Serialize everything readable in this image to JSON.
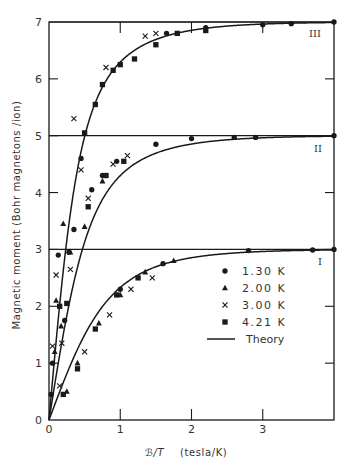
{
  "chart_data": {
    "type": "scatter",
    "title": "",
    "xlabel": "B/T (tesla/K)",
    "xlabel_symbol": "ℬ/T",
    "xlabel_units": "(tesla/K)",
    "ylabel": "Magnetic moment (Bohr magnetons /ion)",
    "xlim": [
      0,
      4.0
    ],
    "ylim": [
      0,
      7
    ],
    "x_ticks": [
      0,
      1,
      2,
      3
    ],
    "y_ticks": [
      0,
      1,
      2,
      3,
      4,
      5,
      6,
      7
    ],
    "x_tick_labels": [
      "0",
      "1",
      "2",
      "3"
    ],
    "y_tick_labels": [
      "0",
      "1",
      "2",
      "3",
      "4",
      "5",
      "6",
      "7"
    ],
    "grid": false,
    "horizontal_reference_lines": [
      3,
      5,
      7
    ],
    "legend_position": "lower right (inside, near y=1.3-2.9)",
    "legend": [
      {
        "marker": "circle",
        "label": "1.30 K"
      },
      {
        "marker": "triangle",
        "label": "2.00 K"
      },
      {
        "marker": "cross",
        "label": "3.00 K"
      },
      {
        "marker": "square",
        "label": "4.21 K"
      },
      {
        "marker": "line",
        "label": "Theory"
      }
    ],
    "curve_labels": [
      {
        "label": "I",
        "saturation": 3,
        "J": 1.5
      },
      {
        "label": "II",
        "saturation": 5,
        "J": 2.5
      },
      {
        "label": "III",
        "saturation": 7,
        "J": 3.5
      }
    ],
    "theory_curves": [
      {
        "name": "I (Theory)",
        "x": [
          0,
          0.25,
          0.5,
          0.75,
          1.0,
          1.25,
          1.5,
          2.0,
          2.5,
          3.0,
          3.5,
          4.0
        ],
        "y": [
          0,
          0.88,
          1.62,
          2.11,
          2.45,
          2.65,
          2.78,
          2.91,
          2.96,
          2.98,
          2.99,
          3.0
        ]
      },
      {
        "name": "II (Theory)",
        "x": [
          0,
          0.1,
          0.2,
          0.3,
          0.4,
          0.5,
          0.75,
          1.0,
          1.25,
          1.5,
          2.0,
          2.5,
          3.0,
          4.0
        ],
        "y": [
          0,
          1.2,
          2.25,
          3.0,
          3.55,
          3.95,
          4.45,
          4.72,
          4.84,
          4.91,
          4.96,
          4.98,
          4.99,
          5.0
        ]
      },
      {
        "name": "III (Theory)",
        "x": [
          0,
          0.05,
          0.1,
          0.2,
          0.3,
          0.4,
          0.5,
          0.75,
          1.0,
          1.5,
          2.0,
          2.5,
          3.0,
          4.0
        ],
        "y": [
          0,
          0.9,
          1.75,
          3.3,
          4.5,
          5.25,
          5.75,
          6.35,
          6.6,
          6.82,
          6.9,
          6.95,
          6.97,
          7.0
        ]
      }
    ],
    "series": [
      {
        "name": "1.30 K",
        "marker": "circle",
        "points": [
          [
            0.05,
            1.0
          ],
          [
            0.13,
            2.9
          ],
          [
            0.45,
            4.6
          ],
          [
            0.03,
            0.45
          ],
          [
            0.22,
            1.75
          ],
          [
            0.28,
            2.95
          ],
          [
            0.35,
            3.35
          ],
          [
            0.6,
            4.05
          ],
          [
            0.75,
            4.3
          ],
          [
            0.95,
            4.55
          ],
          [
            1.5,
            4.85
          ],
          [
            2.0,
            4.95
          ],
          [
            2.6,
            4.97
          ],
          [
            2.9,
            4.97
          ],
          [
            4.0,
            5.0
          ],
          [
            1.0,
            2.3
          ],
          [
            1.6,
            2.75
          ],
          [
            2.8,
            2.98
          ],
          [
            3.7,
            2.99
          ],
          [
            4.0,
            3.0
          ],
          [
            1.65,
            6.8
          ],
          [
            2.2,
            6.9
          ],
          [
            3.0,
            6.95
          ],
          [
            3.4,
            6.97
          ],
          [
            4.0,
            7.0
          ]
        ]
      },
      {
        "name": "2.00 K",
        "marker": "triangle",
        "points": [
          [
            0.08,
            1.2
          ],
          [
            0.1,
            2.1
          ],
          [
            0.2,
            3.45
          ],
          [
            0.17,
            1.65
          ],
          [
            0.3,
            2.95
          ],
          [
            0.5,
            3.4
          ],
          [
            0.75,
            4.2
          ],
          [
            0.25,
            0.5
          ],
          [
            0.4,
            1.0
          ],
          [
            0.7,
            1.7
          ],
          [
            1.0,
            2.2
          ],
          [
            1.35,
            2.6
          ],
          [
            1.75,
            2.8
          ]
        ]
      },
      {
        "name": "3.00 K",
        "marker": "cross",
        "points": [
          [
            0.05,
            1.3
          ],
          [
            0.1,
            2.55
          ],
          [
            0.45,
            4.4
          ],
          [
            0.18,
            1.35
          ],
          [
            0.3,
            2.65
          ],
          [
            0.55,
            3.9
          ],
          [
            0.9,
            4.5
          ],
          [
            1.1,
            4.65
          ],
          [
            0.15,
            0.6
          ],
          [
            0.5,
            1.2
          ],
          [
            0.85,
            1.85
          ],
          [
            1.15,
            2.3
          ],
          [
            1.45,
            2.5
          ],
          [
            0.35,
            5.3
          ],
          [
            0.8,
            6.2
          ],
          [
            1.35,
            6.75
          ],
          [
            1.5,
            6.8
          ]
        ]
      },
      {
        "name": "4.21 K",
        "marker": "square",
        "points": [
          [
            0.15,
            2.0
          ],
          [
            0.5,
            5.05
          ],
          [
            0.65,
            5.55
          ],
          [
            0.75,
            5.9
          ],
          [
            0.9,
            6.15
          ],
          [
            1.0,
            6.25
          ],
          [
            1.2,
            6.35
          ],
          [
            1.5,
            6.6
          ],
          [
            1.8,
            6.8
          ],
          [
            2.2,
            6.85
          ],
          [
            0.25,
            2.05
          ],
          [
            0.55,
            3.75
          ],
          [
            0.8,
            4.3
          ],
          [
            1.05,
            4.55
          ],
          [
            0.2,
            0.45
          ],
          [
            0.4,
            0.9
          ],
          [
            0.65,
            1.6
          ],
          [
            0.95,
            2.2
          ],
          [
            1.25,
            2.5
          ]
        ]
      }
    ]
  },
  "figure": {
    "y_axis_label": "Magnetic moment (Bohr magnetons /ion)",
    "x_axis_symbol": "ℬ/T",
    "x_axis_units": "(tesla/K)",
    "legend": {
      "items": [
        {
          "marker": "circle",
          "label": "1.30  K"
        },
        {
          "marker": "triangle",
          "label": "2.00  K"
        },
        {
          "marker": "cross",
          "label": "3.00  K"
        },
        {
          "marker": "square",
          "label": "4.21  K"
        },
        {
          "marker": "line",
          "label": "Theory"
        }
      ]
    },
    "curve_labels": [
      "I",
      "II",
      "III"
    ],
    "colors": {
      "ink": "#1a1a1a",
      "background": "#ffffff",
      "text": "#333333"
    }
  }
}
